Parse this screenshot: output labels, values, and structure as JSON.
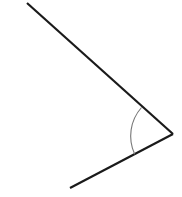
{
  "figure": {
    "kind": "geometry-angle-diagram",
    "canvas": {
      "width": 182,
      "height": 197,
      "background_color": "#ffffff"
    },
    "vertex": {
      "name": "angle-vertex",
      "x": 173,
      "y": 134
    },
    "rays": [
      {
        "name": "upper-ray",
        "from_x": 27,
        "from_y": 3,
        "to_x": 173,
        "to_y": 134,
        "color": "#1a1a1a",
        "width": 2.2,
        "direction": "down-right"
      },
      {
        "name": "lower-ray",
        "from_x": 173,
        "from_y": 134,
        "to_x": 70,
        "to_y": 188,
        "color": "#1a1a1a",
        "width": 2.2,
        "direction": "down-left"
      }
    ],
    "arc": {
      "name": "angle-arc",
      "radius": 43,
      "color": "#777777",
      "width": 1.1,
      "start_x": 141.5,
      "start_y": 107.5,
      "end_x": 134.7,
      "end_y": 154.2,
      "sweep_flag": 0,
      "large_arc_flag": 0,
      "measure_degrees": 69
    },
    "labels": []
  }
}
